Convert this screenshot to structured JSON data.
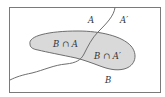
{
  "diagram": {
    "type": "venn",
    "colors": {
      "background": "#ffffff",
      "frame_stroke": "#7a7a7a",
      "region_fill": "#d9d9d9",
      "region_stroke": "#6e6e6e",
      "divider_stroke": "#6e6e6e",
      "text": "#333333"
    },
    "labels": {
      "set_a": "A",
      "set_a_complement": "A′",
      "b_intersect_a": "B ∩ A",
      "b_intersect_a_complement": "B ∩ A′",
      "set_b": "B"
    }
  }
}
